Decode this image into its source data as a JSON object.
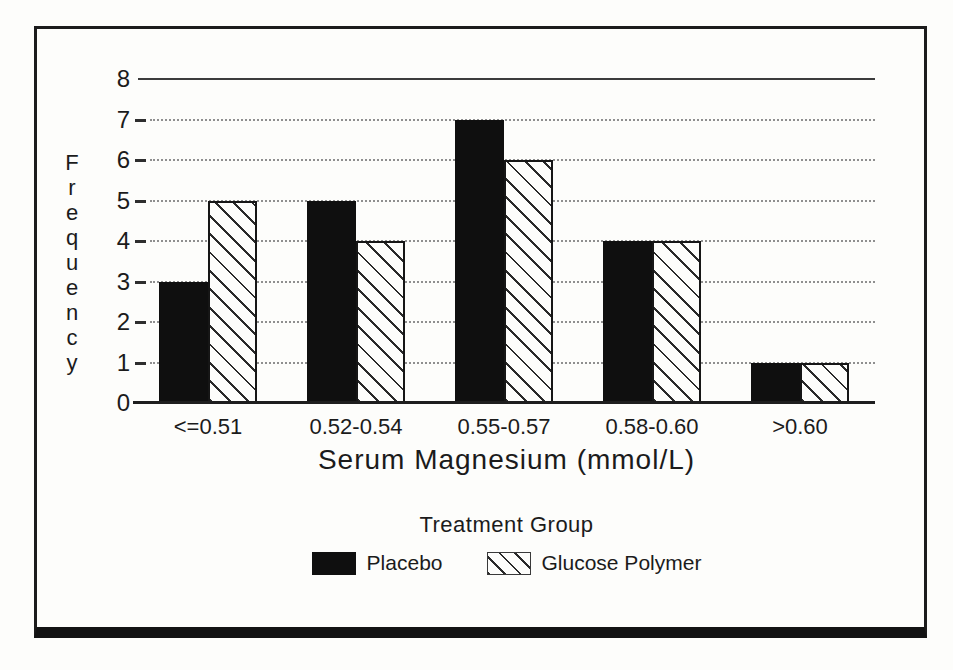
{
  "figure": {
    "kind": "scanned statistical figure",
    "paper_color": "#fdfdfb",
    "ink_color": "#1b1b1b",
    "bar_color": "#0f0f0f"
  },
  "chart_data": {
    "type": "bar",
    "title": "",
    "categories": [
      "<=0.51",
      "0.52-0.54",
      "0.55-0.57",
      "0.58-0.60",
      ">0.60"
    ],
    "series": [
      {
        "name": "Placebo",
        "style": "solid",
        "values": [
          3,
          5,
          7,
          4,
          1
        ]
      },
      {
        "name": "Glucose Polymer",
        "style": "hatched",
        "values": [
          5,
          4,
          6,
          4,
          1
        ]
      }
    ],
    "xlabel": "Serum Magnesium (mmol/L)",
    "ylabel": "Frequency",
    "legend_title": "Treatment Group",
    "legend_position": "bottom",
    "ylim": [
      0,
      8
    ],
    "yticks": [
      0,
      1,
      2,
      3,
      4,
      5,
      6,
      7,
      8
    ],
    "grid": {
      "solid_at": [
        8
      ],
      "dotted_at": [
        1,
        2,
        3,
        4,
        5,
        6,
        7
      ],
      "orientation": "horizontal"
    }
  }
}
